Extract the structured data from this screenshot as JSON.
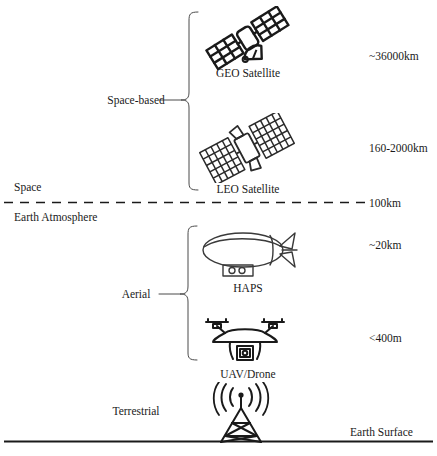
{
  "diagram": {
    "background_color": "#ffffff",
    "stroke_color": "#1a1a1a",
    "width": 437,
    "height": 456
  },
  "groups": [
    {
      "id": "space-based",
      "label": "Space-based"
    },
    {
      "id": "aerial",
      "label": "Aerial"
    },
    {
      "id": "terrestrial",
      "label": "Terrestrial"
    }
  ],
  "nodes": [
    {
      "id": "geo-satellite",
      "label": "GEO Satellite",
      "altitude": "~36000km",
      "icon": "geo-satellite-icon"
    },
    {
      "id": "leo-satellite",
      "label": "LEO Satellite",
      "altitude": "160-2000km",
      "icon": "leo-satellite-icon"
    },
    {
      "id": "haps",
      "label": "HAPS",
      "altitude": "~20km",
      "icon": "airship-icon"
    },
    {
      "id": "uav-drone",
      "label": "UAV/Drone",
      "altitude": "<400m",
      "icon": "drone-icon"
    },
    {
      "id": "base-station",
      "label": "",
      "altitude": "",
      "icon": "cell-tower-icon"
    }
  ],
  "boundaries": [
    {
      "id": "space",
      "label": "Space"
    },
    {
      "id": "earth-atmosphere",
      "label": "Earth Atmosphere",
      "altitude": "100km",
      "style": "dashed"
    },
    {
      "id": "earth-surface",
      "label": "Earth Surface",
      "style": "solid"
    }
  ],
  "altitudes": {
    "geo": "~36000km",
    "leo": "160-2000km",
    "atmosphere": "100km",
    "haps": "~20km",
    "drone": "<400m"
  },
  "labels": {
    "space": "Space",
    "earth_atmosphere": "Earth Atmosphere",
    "earth_surface": "Earth Surface",
    "space_based": "Space-based",
    "aerial": "Aerial",
    "terrestrial": "Terrestrial",
    "geo_satellite": "GEO Satellite",
    "leo_satellite": "LEO Satellite",
    "haps": "HAPS",
    "uav_drone": "UAV/Drone"
  }
}
